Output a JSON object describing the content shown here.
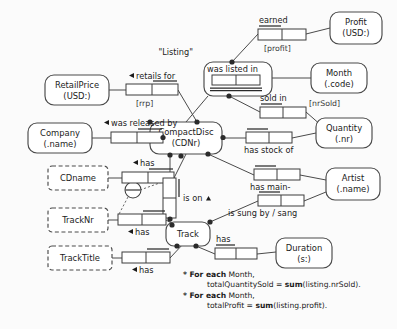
{
  "diagram": {
    "title_note": "ORM conceptual schema diagram for CD sales listings",
    "entities": [
      {
        "id": "retailprice",
        "name": "RetailPrice",
        "ref": "(USD:)",
        "kind": "entity",
        "x": 45,
        "y": 75,
        "w": 64,
        "h": 30
      },
      {
        "id": "company",
        "name": "Company",
        "ref": "(.name)",
        "kind": "entity",
        "x": 28,
        "y": 123,
        "w": 64,
        "h": 30
      },
      {
        "id": "cdname",
        "name": "CDname",
        "ref": "",
        "kind": "value",
        "x": 48,
        "y": 166,
        "w": 60,
        "h": 24
      },
      {
        "id": "tracknr",
        "name": "TrackNr",
        "ref": "",
        "kind": "value",
        "x": 48,
        "y": 210,
        "w": 60,
        "h": 24
      },
      {
        "id": "tracktitle",
        "name": "TrackTitle",
        "ref": "",
        "kind": "value",
        "x": 48,
        "y": 248,
        "w": 64,
        "h": 24
      },
      {
        "id": "compactdisc",
        "name": "CompactDisc",
        "ref": "(CDNr)",
        "kind": "entity",
        "x": 150,
        "y": 122,
        "w": 72,
        "h": 32
      },
      {
        "id": "track",
        "name": "Track",
        "ref": "",
        "kind": "entity",
        "x": 166,
        "y": 222,
        "w": 44,
        "h": 24
      },
      {
        "id": "profit",
        "name": "Profit",
        "ref": "(USD:)",
        "kind": "entity",
        "x": 330,
        "y": 12,
        "w": 52,
        "h": 32
      },
      {
        "id": "month",
        "name": "Month",
        "ref": "(.code)",
        "kind": "entity",
        "x": 311,
        "y": 63,
        "w": 56,
        "h": 30
      },
      {
        "id": "quantity",
        "name": "Quantity",
        "ref": "(.nr)",
        "kind": "entity",
        "x": 316,
        "y": 118,
        "w": 56,
        "h": 30
      },
      {
        "id": "artist",
        "name": "Artist",
        "ref": "(.name)",
        "kind": "entity",
        "x": 326,
        "y": 168,
        "w": 54,
        "h": 32
      },
      {
        "id": "duration",
        "name": "Duration",
        "ref": "(s:)",
        "kind": "entity",
        "x": 276,
        "y": 238,
        "w": 56,
        "h": 30
      }
    ],
    "objectified": {
      "id": "listing",
      "label": "\"Listing\"",
      "predicate": "was listed in",
      "x": 204,
      "y": 62,
      "w": 68,
      "h": 34
    },
    "predicates": [
      {
        "id": "rrp",
        "reading": "retails for",
        "derivation": "[rrp]",
        "arrow": "left"
      },
      {
        "id": "released_by",
        "reading": "was released by",
        "derivation": "",
        "arrow": "left"
      },
      {
        "id": "cd_has_name",
        "reading": "has",
        "derivation": "",
        "arrow": "left"
      },
      {
        "id": "earned",
        "reading": "earned",
        "derivation": "[profit]",
        "arrow": "none"
      },
      {
        "id": "sold_in",
        "reading": "sold in",
        "derivation": "[nrSold]",
        "arrow": "none"
      },
      {
        "id": "has_stock_of",
        "reading": "has stock of",
        "derivation": "",
        "arrow": "none"
      },
      {
        "id": "has_main_artist",
        "reading": "has main-",
        "derivation": "",
        "arrow": "none"
      },
      {
        "id": "is_sung_by",
        "reading": "is sung by / sang",
        "derivation": "",
        "arrow": "none"
      },
      {
        "id": "is_on",
        "reading": "is on",
        "derivation": "",
        "arrow": "up"
      },
      {
        "id": "track_has_nr",
        "reading": "has",
        "derivation": "",
        "arrow": "left"
      },
      {
        "id": "track_has_title",
        "reading": "has",
        "derivation": "",
        "arrow": "left"
      },
      {
        "id": "track_has_duration",
        "reading": "has",
        "derivation": "",
        "arrow": "none"
      }
    ],
    "constraints": [
      {
        "id": "external-uniqueness",
        "type": "external-uniqueness",
        "symbol": "circle-with-bar",
        "x": 132,
        "y": 190
      }
    ],
    "rules": [
      {
        "star": "*",
        "lead": "For each",
        "subject": "Month,",
        "body_prefix": "totalQuantitySold = ",
        "fn": "sum",
        "body_suffix": "(listing.nrSold)."
      },
      {
        "star": "*",
        "lead": "For each",
        "subject": "Month,",
        "body_prefix": "totalProfit = ",
        "fn": "sum",
        "body_suffix": "(listing.profit)."
      }
    ],
    "colors": {
      "background": "#fbfbfb",
      "stroke": "#4a4a4a",
      "text": "#1b1b1b",
      "dot": "#2b2b2b"
    }
  }
}
